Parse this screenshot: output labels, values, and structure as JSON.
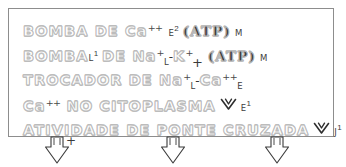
{
  "diagram": {
    "frame": {
      "border_color": "#8d8d8d",
      "background": "#ffffff"
    },
    "text_outline_color": "#b9b9b9",
    "pen_color": "#333333",
    "rows": [
      {
        "id": "row-bomba-ca",
        "main_text": "BOMBA DE Ca",
        "charge": "++",
        "label": "E",
        "label_sup": "2",
        "enzyme": "(ATP)",
        "enzyme_label": "M",
        "has_chevron": false
      },
      {
        "id": "row-bomba-na-k",
        "main_text": "BOMBA",
        "inline_label": "L",
        "inline_label_sup": "1",
        "main_text_2": "DE Na",
        "charge": "+",
        "sub": "L",
        "dash": "-",
        "main_text_3": "K",
        "charge_2": "+",
        "plus_below": "+",
        "enzyme": "(ATP)",
        "enzyme_label": "M",
        "has_chevron": false
      },
      {
        "id": "row-trocador-na-ca",
        "main_text": "TROCADOR DE Na",
        "charge": "+",
        "sub": "L",
        "dash": "-",
        "main_text_2": "Ca",
        "charge_2": "++",
        "sub_2": "E",
        "has_chevron": false
      },
      {
        "id": "row-ca-citoplasma",
        "main_text": "Ca",
        "charge": "++",
        "main_text_2": "NO CITOPLASMA",
        "has_chevron": true,
        "chevron_label": "E",
        "chevron_label_sup": "1"
      },
      {
        "id": "row-ponte-cruzada",
        "main_text": "ATIVIDADE DE PONTE CRUZADA",
        "has_chevron": true,
        "chevron_label": "J",
        "chevron_label_sup": "1"
      }
    ],
    "bottom_arrows": [
      {
        "id": "arrow-left",
        "annotation": "+"
      },
      {
        "id": "arrow-center",
        "annotation": ""
      },
      {
        "id": "arrow-right",
        "annotation": ""
      }
    ]
  }
}
